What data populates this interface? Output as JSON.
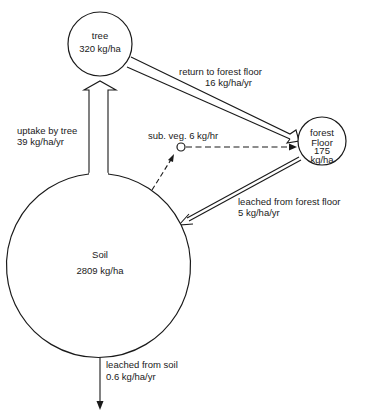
{
  "diagram": {
    "type": "nutrient-cycle",
    "nodes": {
      "tree": {
        "name": "tree",
        "value": "320 kg/ha"
      },
      "forest_floor": {
        "name_line1": "forest",
        "name_line2": "Floor",
        "value_line1": "175",
        "value_line2": "kg/ha"
      },
      "soil": {
        "name": "Soil",
        "value": "2809 kg/ha"
      },
      "sub_veg": {
        "label": "sub. veg. 6 kg/hr"
      }
    },
    "flows": {
      "uptake": {
        "label": "uptake by tree",
        "value": "39 kg/ha/yr",
        "from": "soil",
        "to": "tree",
        "style": "wide-hollow-arrow"
      },
      "return": {
        "label": "return to forest floor",
        "value": "16 kg/ha/yr",
        "from": "tree",
        "to": "forest_floor",
        "style": "wide-hollow-arrow"
      },
      "leached_floor": {
        "label": "leached from forest floor",
        "value": "5 kg/ha/yr",
        "from": "forest_floor",
        "to": "soil",
        "style": "narrow-hollow-arrow"
      },
      "leached_soil": {
        "label": "leached from soil",
        "value": "0.6 kg/ha/yr",
        "from": "soil",
        "to": "out",
        "style": "single-line-arrow"
      },
      "soil_to_subveg": {
        "from": "soil",
        "to": "sub_veg",
        "style": "dashed-arrow"
      },
      "subveg_to_floor": {
        "from": "sub_veg",
        "to": "forest_floor",
        "style": "dashed-arrow"
      }
    }
  }
}
